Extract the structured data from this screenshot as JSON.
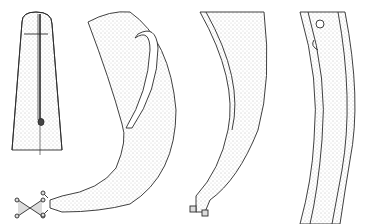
{
  "figure": {
    "title": "",
    "background": "#ffffff",
    "ink_color": "#2a2a2a",
    "stipple_color": "#8a8a8a",
    "panels": [
      {
        "id": "head",
        "description": "anterior end with stylet"
      },
      {
        "id": "spicule-tail",
        "description": "male posterior with spicules and tail with caudal bursa-like tip"
      },
      {
        "id": "tail-curve",
        "description": "curved posterior body with terminal tip"
      },
      {
        "id": "mid-body",
        "description": "mid-body section with vulva region"
      }
    ],
    "labels": []
  }
}
